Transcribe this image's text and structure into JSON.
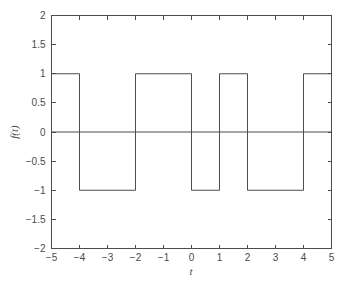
{
  "chart_data": {
    "type": "line",
    "title": "",
    "subtitle": "",
    "xlabel": "t",
    "ylabel": "f(t)",
    "xlim": [
      -5,
      5
    ],
    "ylim": [
      -2,
      2
    ],
    "grid": false,
    "legend": false,
    "legend_position": "none",
    "line_color": "#4d4d4d",
    "background_color": "#ffffff",
    "axis_color": "#4d4d4d",
    "xticks": [
      -5,
      -4,
      -3,
      -2,
      -1,
      0,
      1,
      2,
      3,
      4,
      5
    ],
    "xtick_labels": [
      "−5",
      "−4",
      "−3",
      "−2",
      "−1",
      "0",
      "1",
      "2",
      "3",
      "4",
      "5"
    ],
    "yticks": [
      -2,
      -1.5,
      -1,
      -0.5,
      0,
      0.5,
      1,
      1.5,
      2
    ],
    "ytick_labels": [
      "−2",
      "−1.5",
      "−1",
      "−0.5",
      "0",
      "0.5",
      "1",
      "1.5",
      "2"
    ],
    "series": [
      {
        "name": "f(t) square wave",
        "x": [
          -5,
          -4,
          -4,
          -2,
          -2,
          0,
          0,
          1,
          1,
          2,
          2,
          4,
          4,
          5
        ],
        "y": [
          1,
          1,
          -1,
          -1,
          1,
          1,
          -1,
          -1,
          1,
          1,
          -1,
          -1,
          1,
          1
        ]
      },
      {
        "name": "zero reference line",
        "x": [
          -5,
          5
        ],
        "y": [
          0,
          0
        ]
      }
    ],
    "segments": [
      {
        "from": -5,
        "to": -4,
        "level": 1
      },
      {
        "from": -4,
        "to": -2,
        "level": -1
      },
      {
        "from": -2,
        "to": 0,
        "level": 1
      },
      {
        "from": 0,
        "to": 1,
        "level": -1
      },
      {
        "from": 1,
        "to": 2,
        "level": 1
      },
      {
        "from": 2,
        "to": 4,
        "level": -1
      },
      {
        "from": 4,
        "to": 5,
        "level": 1
      }
    ]
  }
}
